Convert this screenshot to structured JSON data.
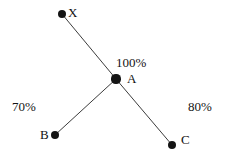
{
  "diagram": {
    "type": "node-link-diagram",
    "background_color": "#ffffff",
    "node_color": "#141414",
    "edge_color": "#3c3c3c",
    "nodes": [
      {
        "id": "X",
        "label": "X",
        "cx": 62,
        "cy": 14,
        "r": 4.2,
        "label_x": 68,
        "label_y": 6
      },
      {
        "id": "A",
        "label": "A",
        "cx": 116,
        "cy": 79,
        "r": 4.6,
        "label_x": 127,
        "label_y": 72
      },
      {
        "id": "B",
        "label": "B",
        "cx": 55,
        "cy": 135,
        "r": 4.2,
        "label_x": 40,
        "label_y": 128
      },
      {
        "id": "C",
        "label": "C",
        "cx": 172,
        "cy": 145,
        "r": 4.4,
        "label_x": 181,
        "label_y": 133
      }
    ],
    "edges": [
      {
        "id": "edge-x-a",
        "from": "X",
        "to": "A",
        "x1": 62,
        "y1": 14,
        "x2": 116,
        "y2": 79
      },
      {
        "id": "edge-b-a",
        "from": "B",
        "to": "A",
        "x1": 55,
        "y1": 135,
        "x2": 116,
        "y2": 79
      },
      {
        "id": "edge-a-c",
        "from": "A",
        "to": "C",
        "x1": 116,
        "y1": 79,
        "x2": 172,
        "y2": 145
      }
    ],
    "edge_labels": [
      {
        "id": "label-100",
        "text": "100%",
        "x": 116,
        "y": 56
      },
      {
        "id": "label-70",
        "text": "70%",
        "x": 12,
        "y": 100
      },
      {
        "id": "label-80",
        "text": "80%",
        "x": 188,
        "y": 100
      }
    ]
  }
}
